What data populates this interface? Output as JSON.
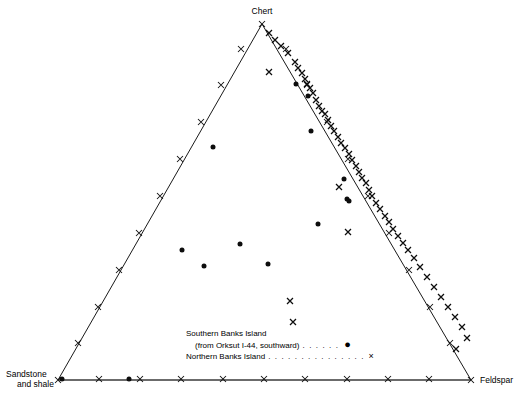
{
  "figure": {
    "width": 524,
    "height": 404,
    "background": "#ffffff",
    "ink_color": "#0d0d0d"
  },
  "apex_labels": {
    "top": "Chert",
    "bottom_left_line1": "Sandstone",
    "bottom_left_line2": "and shale",
    "bottom_right": "Feldspar"
  },
  "legend": {
    "rows": [
      {
        "label": "Southern Banks Island",
        "leader": "",
        "symbol": "",
        "symbol_name": "none",
        "indent": false
      },
      {
        "label": "(from Orksut I-44, southward)",
        "leader": ". . . . . .",
        "symbol": "●",
        "symbol_name": "filled-circle-marker",
        "indent": true
      },
      {
        "label": "Northern Banks Island",
        "leader": ". . . . . . . . . . . . . . .",
        "symbol": "×",
        "symbol_name": "cross-marker",
        "indent": false
      }
    ]
  },
  "chart_data": {
    "type": "scatter",
    "plot_kind": "ternary",
    "title": "",
    "axes": {
      "top_vertex": "Chert",
      "left_vertex": "Sandstone and shale",
      "right_vertex": "Feldspar",
      "range": [
        0,
        100
      ],
      "grid": false,
      "tick_count_per_edge": 10,
      "tick_glyph": "×"
    },
    "legend_position": "bottom-center-inside",
    "geometry_px": {
      "apex_top": [
        262,
        24
      ],
      "apex_left": [
        58,
        380
      ],
      "apex_right": [
        471,
        380
      ]
    },
    "series": [
      {
        "name": "Southern Banks Island (from Orksut I-44, southward)",
        "marker": "filled-circle",
        "marker_size_px": 4.0,
        "points_px": [
          [
            213,
            147
          ],
          [
            311,
            131
          ],
          [
            318,
            224
          ],
          [
            344,
            179
          ],
          [
            347,
            199
          ],
          [
            240,
            244
          ],
          [
            182,
            250
          ],
          [
            204,
            266
          ],
          [
            268,
            264
          ],
          [
            349,
            201
          ],
          [
            62,
            379
          ],
          [
            129,
            379
          ],
          [
            308,
            96
          ],
          [
            296,
            84
          ]
        ]
      },
      {
        "name": "Northern Banks Island",
        "marker": "cross",
        "marker_size_px": 4.0,
        "points_px": [
          [
            269,
            33
          ],
          [
            275,
            40
          ],
          [
            281,
            46
          ],
          [
            288,
            53
          ],
          [
            295,
            62
          ],
          [
            298,
            68
          ],
          [
            302,
            73
          ],
          [
            305,
            79
          ],
          [
            307,
            84
          ],
          [
            310,
            88
          ],
          [
            313,
            93
          ],
          [
            316,
            100
          ],
          [
            319,
            106
          ],
          [
            322,
            111
          ],
          [
            325,
            114
          ],
          [
            328,
            120
          ],
          [
            331,
            126
          ],
          [
            334,
            131
          ],
          [
            338,
            137
          ],
          [
            341,
            143
          ],
          [
            345,
            148
          ],
          [
            349,
            154
          ],
          [
            352,
            160
          ],
          [
            356,
            166
          ],
          [
            359,
            172
          ],
          [
            362,
            178
          ],
          [
            366,
            183
          ],
          [
            369,
            190
          ],
          [
            372,
            196
          ],
          [
            376,
            203
          ],
          [
            380,
            209
          ],
          [
            385,
            216
          ],
          [
            389,
            222
          ],
          [
            393,
            229
          ],
          [
            398,
            236
          ],
          [
            403,
            243
          ],
          [
            408,
            250
          ],
          [
            414,
            258
          ],
          [
            420,
            267
          ],
          [
            427,
            277
          ],
          [
            434,
            287
          ],
          [
            441,
            297
          ],
          [
            448,
            307
          ],
          [
            455,
            317
          ],
          [
            462,
            327
          ],
          [
            467,
            338
          ],
          [
            456,
            349
          ],
          [
            269,
            72
          ],
          [
            339,
            187
          ],
          [
            348,
            232
          ],
          [
            290,
            301
          ],
          [
            293,
            322
          ]
        ]
      }
    ],
    "edge_ticks_px": {
      "left_edge": [
        [
          78,
          343
        ],
        [
          98,
          307
        ],
        [
          119,
          270
        ],
        [
          139,
          233
        ],
        [
          160,
          196
        ],
        [
          180,
          159
        ],
        [
          201,
          122
        ],
        [
          221,
          85
        ],
        [
          241,
          49
        ]
      ],
      "right_edge": [
        [
          450,
          343
        ],
        [
          430,
          307
        ],
        [
          409,
          270
        ],
        [
          389,
          233
        ],
        [
          368,
          196
        ],
        [
          348,
          159
        ],
        [
          327,
          122
        ],
        [
          307,
          85
        ],
        [
          286,
          49
        ]
      ],
      "bottom_edge": [
        [
          99,
          379
        ],
        [
          140,
          379
        ],
        [
          181,
          379
        ],
        [
          223,
          379
        ],
        [
          264,
          379
        ],
        [
          305,
          379
        ],
        [
          347,
          379
        ],
        [
          388,
          379
        ],
        [
          429,
          379
        ]
      ],
      "vertex_ticks": [
        [
          262,
          24
        ],
        [
          58,
          380
        ],
        [
          471,
          380
        ]
      ]
    }
  }
}
